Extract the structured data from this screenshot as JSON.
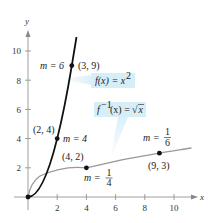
{
  "figure": {
    "axes": {
      "x_label": "x",
      "y_label": "y",
      "x_ticks": [
        "2",
        "4",
        "6",
        "8",
        "10"
      ],
      "y_ticks": [
        "2",
        "4",
        "6",
        "8",
        "10"
      ]
    },
    "functions": {
      "f": {
        "label": "f(x) = x²",
        "lhs": "f(x) = x",
        "exp": "2",
        "color": "#111111"
      },
      "finv": {
        "label": "f⁻¹(x) = √x",
        "lhs_f": "f",
        "lhs_sup": "−1",
        "lhs_rest": "(x) = ",
        "sqrt": "√",
        "arg": "x",
        "color": "#999999"
      }
    },
    "callout_color": "#d6eef8",
    "points": [
      {
        "label": "(3, 9)",
        "x": 3,
        "y": 9,
        "slope_label": "m = 6"
      },
      {
        "label": "(2, 4)",
        "x": 2,
        "y": 4,
        "slope_label": "m = 4"
      },
      {
        "label": "(4, 2)",
        "x": 4,
        "y": 2,
        "slope_label": "m = ",
        "slope_num": "1",
        "slope_den": "4"
      },
      {
        "label": "(9, 3)",
        "x": 9,
        "y": 3,
        "slope_label": "m = ",
        "slope_num": "1",
        "slope_den": "6"
      }
    ]
  }
}
